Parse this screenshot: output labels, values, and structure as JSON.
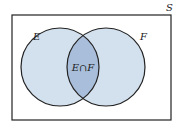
{
  "diagram": {
    "type": "venn",
    "universe_label": "S",
    "set_left_label": "E",
    "set_right_label": "F",
    "intersection_label": "E∩F",
    "colors": {
      "set_fill": "#d3e0ee",
      "intersection_fill": "#a9bedb",
      "stroke": "#222222"
    }
  }
}
